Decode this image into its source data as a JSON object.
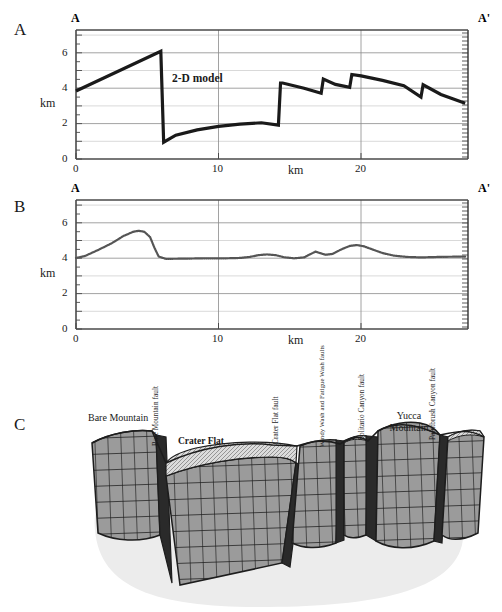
{
  "figure": {
    "panels": [
      {
        "letter": "A",
        "left_end": "A",
        "right_end": "A'"
      },
      {
        "letter": "B",
        "left_end": "A",
        "right_end": "A'"
      },
      {
        "letter": "C"
      }
    ]
  },
  "panel_a": {
    "letter": "A",
    "left_end_label": "A",
    "right_end_label": "A'",
    "annotation": "2-D model",
    "y_axis_label": "km",
    "x_axis_label": "km",
    "y_ticks": [
      "0",
      "2",
      "4",
      "6"
    ],
    "x_ticks": [
      "0",
      "10",
      "20"
    ]
  },
  "panel_b": {
    "letter": "B",
    "left_end_label": "A",
    "right_end_label": "A'",
    "y_axis_label": "km",
    "x_axis_label": "km",
    "y_ticks": [
      "0",
      "2",
      "4",
      "6"
    ],
    "x_ticks": [
      "0",
      "10",
      "20"
    ]
  },
  "panel_c": {
    "letter": "C",
    "labels": [
      {
        "name": "bare-mountain",
        "text": "Bare Mountain",
        "orientation": "horizontal",
        "bold": false
      },
      {
        "name": "bare-mountain-fault",
        "text": "Bare Mountain fault",
        "orientation": "vertical",
        "bold": false
      },
      {
        "name": "crater-flat",
        "text": "Crater Flat",
        "orientation": "horizontal",
        "bold": true
      },
      {
        "name": "crater-flat-fault",
        "text": "Crater Flat fault",
        "orientation": "vertical",
        "bold": false
      },
      {
        "name": "windy-wash-fatigue-wash-faults",
        "text": "Windy Wash and Fatigue Wash faults",
        "orientation": "vertical",
        "bold": false
      },
      {
        "name": "solitario-canyon-fault",
        "text": "Solitario Canyon  fault",
        "orientation": "vertical",
        "bold": false
      },
      {
        "name": "yucca-mountain",
        "text": "Yucca Mountain",
        "orientation": "horizontal",
        "bold": false
      },
      {
        "name": "paintbrush-canyon-fault",
        "text": "Paintbrush Canyon fault",
        "orientation": "vertical",
        "bold": false
      }
    ]
  },
  "colors": {
    "line": "#1a1a1a",
    "grid_major": "#808080",
    "grid_minor": "#c8c8c8",
    "axis": "#4d4d4d",
    "block_fill": "#9a9a9a",
    "basement_fill": "#e8e8e8",
    "basin_fill": "#d8d8d8"
  },
  "chart_data": [
    {
      "type": "line",
      "panel": "A",
      "title": "2-D model",
      "xlabel": "km",
      "ylabel": "km",
      "xlim": [
        0,
        27.5
      ],
      "ylim": [
        0,
        7.3
      ],
      "xticks": [
        0,
        10,
        20
      ],
      "yticks": [
        0,
        2,
        4,
        6
      ],
      "grid": true,
      "series": [
        {
          "name": "2-D model",
          "x": [
            0.0,
            5.95,
            6.15,
            7.0,
            8.5,
            10.0,
            11.5,
            13.0,
            14.2,
            14.35,
            14.5,
            16.0,
            17.2,
            17.35,
            18.2,
            19.2,
            19.35,
            20.0,
            21.5,
            23.0,
            24.2,
            24.35,
            25.6,
            27.3
          ],
          "y": [
            3.85,
            6.1,
            0.95,
            1.35,
            1.65,
            1.85,
            1.97,
            2.05,
            1.92,
            4.3,
            4.3,
            4.0,
            3.72,
            4.52,
            4.22,
            4.05,
            4.78,
            4.7,
            4.45,
            4.15,
            3.5,
            4.2,
            3.65,
            3.15
          ]
        }
      ]
    },
    {
      "type": "line",
      "panel": "B",
      "title": "",
      "xlabel": "km",
      "ylabel": "km",
      "xlim": [
        0,
        27.5
      ],
      "ylim": [
        0,
        7.3
      ],
      "xticks": [
        0,
        10,
        20
      ],
      "yticks": [
        0,
        2,
        4,
        6
      ],
      "grid": true,
      "series": [
        {
          "name": "gravity/elevation profile",
          "x": [
            0.0,
            0.6,
            1.5,
            2.5,
            3.3,
            4.0,
            4.4,
            4.8,
            5.2,
            5.5,
            5.8,
            6.3,
            7.5,
            9.0,
            10.5,
            11.5,
            12.2,
            12.8,
            13.4,
            14.0,
            14.6,
            15.3,
            16.0,
            16.4,
            16.8,
            17.1,
            17.5,
            18.0,
            18.6,
            19.2,
            19.7,
            20.2,
            20.8,
            21.5,
            22.3,
            23.2,
            24.2,
            25.5,
            27.3
          ],
          "y": [
            4.02,
            4.12,
            4.45,
            4.85,
            5.25,
            5.5,
            5.56,
            5.5,
            5.2,
            4.6,
            4.1,
            3.97,
            3.98,
            4.0,
            4.0,
            4.02,
            4.08,
            4.18,
            4.22,
            4.18,
            4.06,
            4.0,
            4.05,
            4.22,
            4.38,
            4.3,
            4.2,
            4.25,
            4.5,
            4.7,
            4.75,
            4.68,
            4.5,
            4.3,
            4.15,
            4.08,
            4.05,
            4.08,
            4.1
          ]
        }
      ]
    }
  ]
}
